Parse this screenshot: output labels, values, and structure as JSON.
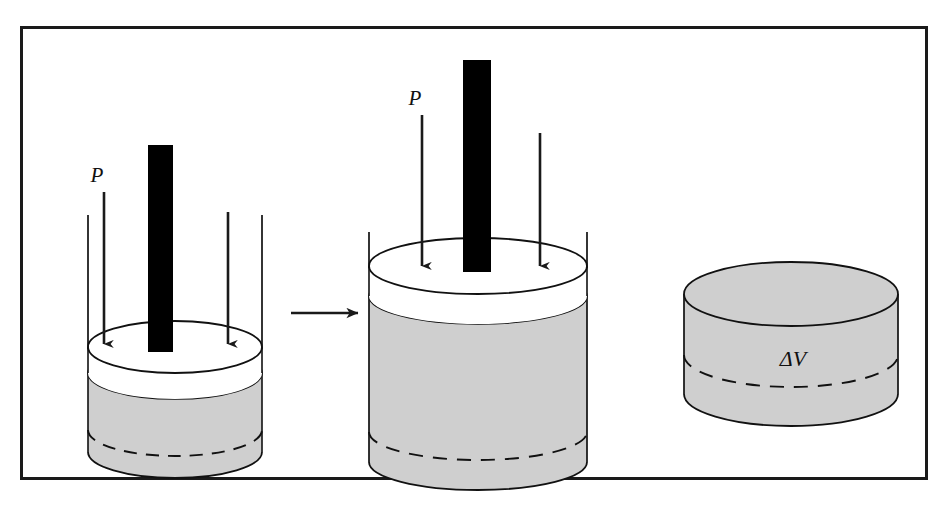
{
  "figure": {
    "frame": {
      "border_color": "#1a1a1a",
      "border_width": 3,
      "x": 20,
      "y": 26,
      "width": 908,
      "height": 454,
      "background": "#ffffff"
    },
    "colors": {
      "gas_fill": "#cfcfcf",
      "piston_fill": "#ffffff",
      "rod_fill": "#000000",
      "outline": "#111111",
      "arrow": "#1a1a1a",
      "background": "#ffffff"
    },
    "panels": [
      {
        "id": "initial-state",
        "name": "initial-state-cylinder",
        "caption": "",
        "pressure_label": "P",
        "pressure_label_x": 97,
        "pressure_label_y": 182,
        "cylinder": {
          "cx": 175,
          "wall_left_x": 88,
          "wall_right_x": 262,
          "wall_top_y": 215,
          "rx": 87,
          "ry": 26,
          "piston_top_cy": 347,
          "piston_thickness": 26,
          "gas_bottom_cy": 452,
          "dashed_back_cy": 430
        },
        "rod": {
          "x": 148,
          "y": 145,
          "width": 25,
          "height": 207
        },
        "arrows": [
          {
            "name": "pressure-arrow-left",
            "x": 104,
            "y1": 192,
            "y2": 350
          },
          {
            "name": "pressure-arrow-right",
            "x": 228,
            "y1": 212,
            "y2": 350
          }
        ]
      },
      {
        "id": "expanded-state",
        "name": "expanded-state-cylinder",
        "caption": "",
        "pressure_label": "P",
        "pressure_label_x": 415,
        "pressure_label_y": 105,
        "cylinder": {
          "cx": 478,
          "wall_left_x": 369,
          "wall_right_x": 588,
          "wall_top_y": 232,
          "rx": 109,
          "ry": 28,
          "piston_top_cy": 266,
          "piston_thickness": 30,
          "gas_bottom_cy": 462,
          "dashed_back_cy": 432
        },
        "rod": {
          "x": 463,
          "y": 60,
          "width": 28,
          "height": 212
        },
        "arrows": [
          {
            "name": "pressure-arrow-left",
            "x": 422,
            "y1": 115,
            "y2": 272
          },
          {
            "name": "pressure-arrow-right",
            "x": 540,
            "y1": 133,
            "y2": 272
          }
        ]
      },
      {
        "id": "volume-change",
        "name": "volume-change-disc",
        "caption": "",
        "volume_label": "ΔV",
        "volume_label_x": 793,
        "volume_label_y": 366,
        "cylinder": {
          "cx": 791,
          "wall_left_x": 684,
          "wall_right_x": 898,
          "rx": 107,
          "ry": 32,
          "top_cy": 294,
          "bottom_cy": 394,
          "dashed_back_cy": 355
        }
      }
    ],
    "transition_arrow": {
      "name": "transition-arrow",
      "label": "",
      "x1": 291,
      "x2": 360,
      "y": 313
    }
  }
}
